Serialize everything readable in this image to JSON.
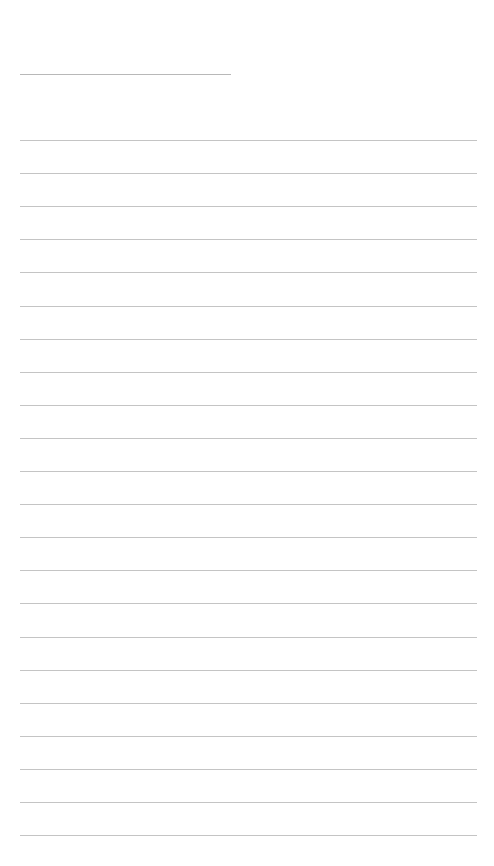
{
  "page": {
    "type": "blank-lined-sheet",
    "title_line": {
      "text": ""
    },
    "ruled_lines": {
      "count": 22,
      "first_y": 140,
      "spacing": 33.1,
      "lines": [
        "",
        "",
        "",
        "",
        "",
        "",
        "",
        "",
        "",
        "",
        "",
        "",
        "",
        "",
        "",
        "",
        "",
        "",
        "",
        "",
        "",
        ""
      ]
    },
    "colors": {
      "background": "#ffffff",
      "line": "#c4c4c4",
      "title_line": "#b8b8b8"
    }
  }
}
